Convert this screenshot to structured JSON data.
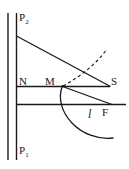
{
  "figure": {
    "type": "geometric-optics-diagram",
    "stroke_color": "#1a1a1a",
    "background_color": "#ffffff",
    "labels": {
      "p2": "P",
      "p2_sub": "2",
      "p1": "P",
      "p1_sub": "1",
      "n": "N",
      "m": "M",
      "s": "S",
      "curve": "l",
      "f": "F"
    },
    "geometry": {
      "vertical_line_outer": {
        "x": 8,
        "y1": 13,
        "y2": 160
      },
      "vertical_line_inner": {
        "x": 16.5,
        "y1": 13,
        "y2": 160
      },
      "horizontal_line_upper": {
        "x1": 16.5,
        "x2": 110,
        "y": 86.5
      },
      "horizontal_line_lower": {
        "x1": 16.5,
        "x2": 126,
        "y": 104.5
      },
      "diagonal_ray": {
        "x1": 16.5,
        "y1": 36,
        "x2": 110,
        "y2": 86.5
      },
      "segment_m_to_f": {
        "x1": 62.5,
        "y1": 86.5,
        "x2": 112,
        "y2": 104.5
      },
      "dashed_arc": {
        "start": [
          63,
          86
        ],
        "control": [
          92,
          70
        ],
        "end": [
          107,
          49
        ]
      },
      "solid_curve": {
        "start": [
          62.5,
          86
        ],
        "control1": [
          52,
          112
        ],
        "control2": [
          82,
          142
        ],
        "end": [
          113,
          138
        ]
      }
    }
  }
}
